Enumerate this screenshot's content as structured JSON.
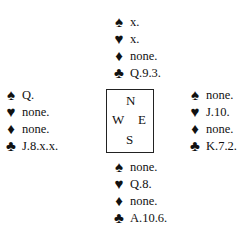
{
  "north": {
    "spades": "x.",
    "hearts": "x.",
    "diamonds": "none.",
    "clubs": "Q.9.3."
  },
  "west": {
    "spades": "Q.",
    "hearts": "none.",
    "diamonds": "none.",
    "clubs": "J.8.x.x."
  },
  "east": {
    "spades": "none.",
    "hearts": "J.10.",
    "diamonds": "none.",
    "clubs": "K.7.2."
  },
  "south": {
    "spades": "none.",
    "hearts": "Q.8.",
    "diamonds": "none.",
    "clubs": "A.10.6."
  },
  "compass": {
    "n": "N",
    "w": "W",
    "e": "E",
    "s": "S"
  },
  "suits": {
    "spades": "♠",
    "hearts": "♥",
    "diamonds": "♦",
    "clubs": "♣"
  }
}
